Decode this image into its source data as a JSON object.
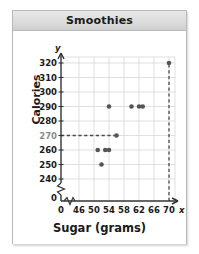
{
  "header": {
    "title": "Smoothies"
  },
  "chart_data": {
    "type": "scatter",
    "title": "Smoothies",
    "xlabel": "Sugar (grams)",
    "ylabel": "Calories",
    "x_axis_symbol": "x",
    "y_axis_symbol": "y",
    "xlim": [
      44,
      72
    ],
    "ylim": [
      235,
      325
    ],
    "x_ticks": [
      "0",
      "46",
      "50",
      "54",
      "58",
      "62",
      "66",
      "70"
    ],
    "y_ticks": [
      "0",
      "240",
      "250",
      "260",
      "270",
      "280",
      "290",
      "300",
      "310",
      "320"
    ],
    "highlighted_y_tick": "270",
    "grid": true,
    "axis_break": true,
    "legend": "none",
    "points": [
      {
        "x": 52,
        "y": 250
      },
      {
        "x": 51,
        "y": 260
      },
      {
        "x": 53,
        "y": 260
      },
      {
        "x": 54,
        "y": 260
      },
      {
        "x": 56,
        "y": 270
      },
      {
        "x": 54,
        "y": 290
      },
      {
        "x": 60,
        "y": 290
      },
      {
        "x": 62,
        "y": 290
      },
      {
        "x": 63,
        "y": 290
      },
      {
        "x": 70,
        "y": 320
      }
    ],
    "annotations": [
      {
        "name": "horizontal-guide",
        "style": "dashed",
        "from": [
          44,
          270
        ],
        "to": [
          56,
          270
        ]
      },
      {
        "name": "vertical-guide",
        "style": "dashed",
        "from": [
          70,
          236
        ],
        "to": [
          70,
          320
        ]
      }
    ]
  }
}
